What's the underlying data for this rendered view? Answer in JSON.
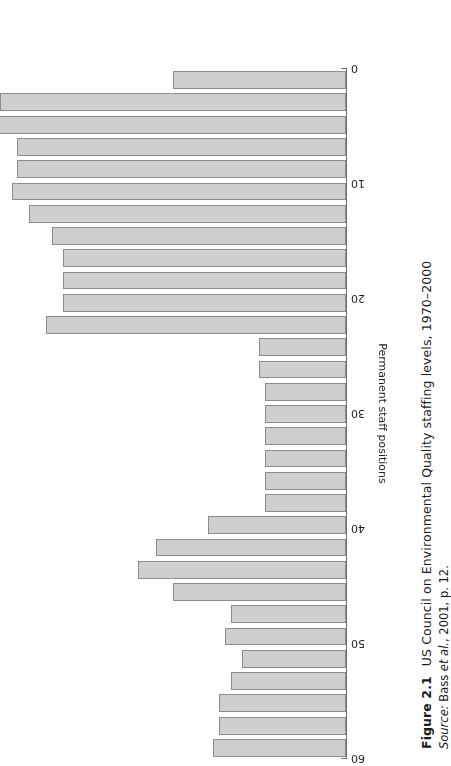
{
  "figure": {
    "number": "Figure 2.1",
    "title": "US Council on Environmental Quality staffing levels, 1970–2000",
    "source_label": "Source:",
    "source_rest": " Bass ",
    "source_etal": "et al.",
    "source_tail": ", 2001, p. 12."
  },
  "chart_data": {
    "type": "bar",
    "orientation": "horizontal",
    "title": "US Council on Environmental Quality staffing levels, 1970–2000",
    "xlabel": "",
    "ylabel": "Permanent staff positions",
    "ylim": [
      0,
      60
    ],
    "grid": false,
    "legend": "none",
    "rotation_note": "chart rendered upside-down (180°) on the page",
    "tick_labels": [
      "0",
      "10",
      "20",
      "30",
      "40",
      "50",
      "60"
    ],
    "tick_values": [
      0,
      10,
      20,
      30,
      40,
      50,
      60
    ],
    "categories": [
      "1970",
      "1971",
      "1972",
      "1973",
      "1974",
      "1975",
      "1976",
      "1977",
      "1978",
      "1979",
      "1980",
      "1981",
      "1982",
      "1983",
      "1984",
      "1985",
      "1986",
      "1987",
      "1988",
      "1989",
      "1990",
      "1991",
      "1992",
      "1993",
      "1994",
      "1995",
      "1996",
      "1997",
      "1998",
      "1999",
      "2000"
    ],
    "values": [
      30,
      60,
      62,
      57,
      57,
      58,
      55,
      51,
      49,
      49,
      49,
      52,
      15,
      15,
      14,
      14,
      14,
      14,
      14,
      14,
      24,
      33,
      36,
      30,
      20,
      21,
      18,
      20,
      22,
      22,
      23
    ],
    "series": [
      {
        "name": "Permanent staff positions",
        "values": [
          30,
          60,
          62,
          57,
          57,
          58,
          55,
          51,
          49,
          49,
          49,
          52,
          15,
          15,
          14,
          14,
          14,
          14,
          14,
          14,
          24,
          33,
          36,
          30,
          20,
          21,
          18,
          20,
          22,
          22,
          23
        ]
      }
    ],
    "bar_fill": "#cfcfcf",
    "bar_stroke": "#8c8c8c",
    "axis_color": "#6e6e6e"
  }
}
